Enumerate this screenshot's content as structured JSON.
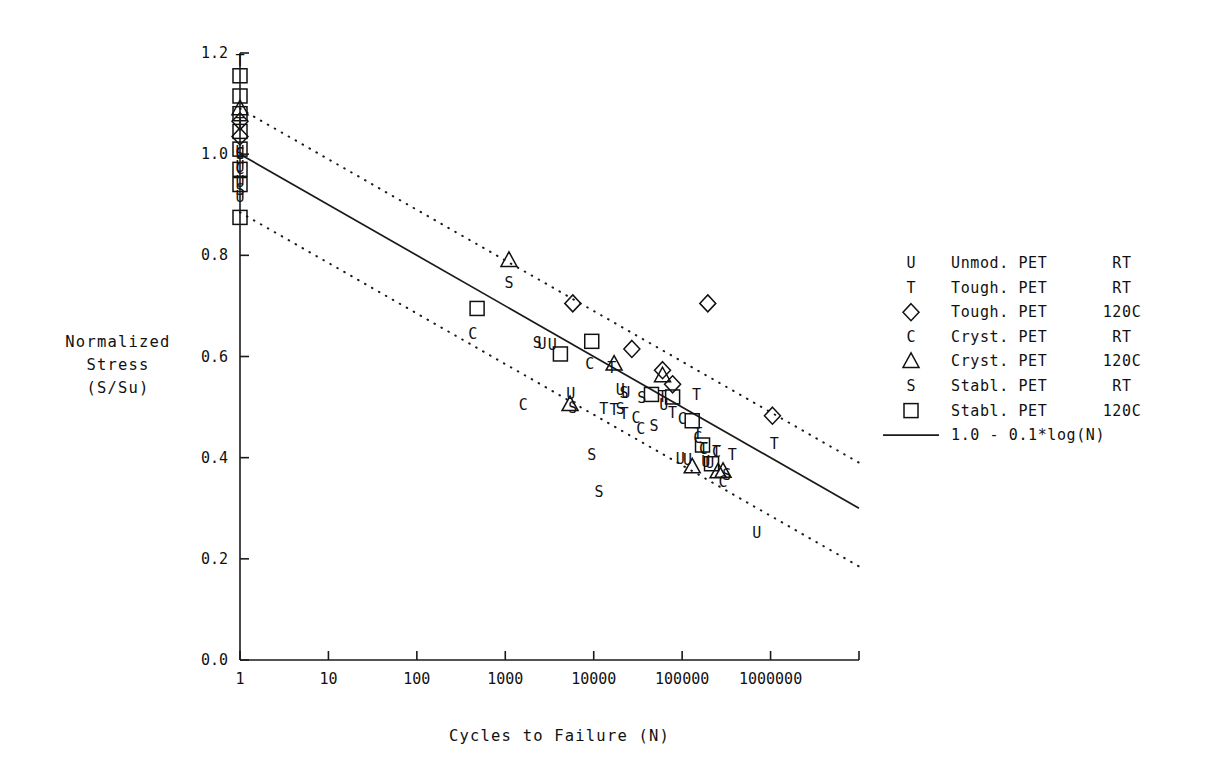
{
  "chart_data": {
    "type": "scatter",
    "title": "",
    "xlabel": "Cycles to Failure  (N)",
    "ylabel": "Normalized\nStress\n(S/Su)",
    "ylabel_lines": [
      "Normalized",
      "Stress",
      "(S/Su)"
    ],
    "xscale": "log",
    "yscale": "linear",
    "xlim": [
      1,
      10000000
    ],
    "ylim": [
      0.0,
      1.2
    ],
    "grid": false,
    "legend_position": "right",
    "xticks": [
      {
        "value": 1,
        "label": "1"
      },
      {
        "value": 10,
        "label": "10"
      },
      {
        "value": 100,
        "label": "100"
      },
      {
        "value": 1000,
        "label": "1000"
      },
      {
        "value": 10000,
        "label": "10000"
      },
      {
        "value": 100000,
        "label": "100000"
      },
      {
        "value": 1000000,
        "label": "1000000"
      },
      {
        "value": 10000000,
        "label": ""
      }
    ],
    "yticks": [
      {
        "value": 0.0,
        "label": "0.0"
      },
      {
        "value": 0.2,
        "label": "0.2"
      },
      {
        "value": 0.4,
        "label": "0.4"
      },
      {
        "value": 0.6,
        "label": "0.6"
      },
      {
        "value": 0.8,
        "label": "0.8"
      },
      {
        "value": 1.0,
        "label": "1.0"
      },
      {
        "value": 1.2,
        "label": "1.2"
      }
    ],
    "fit_line": {
      "label": "1.0 - 0.1*log(N)",
      "style": "solid",
      "intercept": 1.0,
      "slope_per_decade": -0.1,
      "x_from": 1,
      "x_to": 10000000
    },
    "bands": [
      {
        "name": "upper-bound",
        "style": "dotted",
        "offset": 0.09,
        "x_from": 1,
        "x_to": 10000000
      },
      {
        "name": "lower-bound",
        "style": "dotted",
        "offset": -0.115,
        "x_from": 1,
        "x_to": 10000000
      }
    ],
    "series": [
      {
        "name": "Unmod. PET RT",
        "key": "unmod-pet-rt",
        "marker": "U",
        "marker_type": "letter",
        "points": [
          [
            1,
            1.005
          ],
          [
            1,
            0.975
          ],
          [
            1,
            0.945
          ],
          [
            1,
            0.915
          ],
          [
            2600,
            0.625
          ],
          [
            3400,
            0.622
          ],
          [
            5500,
            0.525
          ],
          [
            20000,
            0.533
          ],
          [
            23000,
            0.527
          ],
          [
            62000,
            0.505
          ],
          [
            95000,
            0.398
          ],
          [
            115000,
            0.396
          ],
          [
            185000,
            0.392
          ],
          [
            205000,
            0.389
          ],
          [
            700000,
            0.251
          ]
        ]
      },
      {
        "name": "Tough. PET RT",
        "key": "tough-pet-rt",
        "marker": "T",
        "marker_type": "letter",
        "points": [
          [
            1,
            1.185
          ],
          [
            1,
            1.06
          ],
          [
            16000,
            0.578
          ],
          [
            13000,
            0.497
          ],
          [
            17000,
            0.494
          ],
          [
            22000,
            0.487
          ],
          [
            60000,
            0.52
          ],
          [
            78000,
            0.489
          ],
          [
            145000,
            0.524
          ],
          [
            175000,
            0.418
          ],
          [
            150000,
            0.447
          ],
          [
            245000,
            0.412
          ],
          [
            370000,
            0.405
          ],
          [
            1100000,
            0.427
          ]
        ]
      },
      {
        "name": "Tough. PET 120C",
        "key": "tough-pet-120c",
        "marker": "diamond",
        "marker_type": "symbol",
        "points": [
          [
            1,
            1.065
          ],
          [
            1,
            1.035
          ],
          [
            5800,
            0.705
          ],
          [
            27000,
            0.615
          ],
          [
            60000,
            0.573
          ],
          [
            78000,
            0.545
          ],
          [
            195000,
            0.705
          ],
          [
            1050000,
            0.483
          ]
        ]
      },
      {
        "name": "Cryst. PET RT",
        "key": "cryst-pet-rt",
        "marker": "C",
        "marker_type": "letter",
        "points": [
          [
            1,
            1.0
          ],
          [
            1,
            0.97
          ],
          [
            430,
            0.645
          ],
          [
            1600,
            0.505
          ],
          [
            9000,
            0.585
          ],
          [
            30000,
            0.478
          ],
          [
            34000,
            0.457
          ],
          [
            100000,
            0.477
          ],
          [
            150000,
            0.438
          ],
          [
            175000,
            0.418
          ],
          [
            245000,
            0.412
          ],
          [
            290000,
            0.352
          ]
        ]
      },
      {
        "name": "Cryst. PET 120C",
        "key": "cryst-pet-120c",
        "marker": "triangle",
        "marker_type": "symbol",
        "points": [
          [
            1,
            1.09
          ],
          [
            1100,
            0.79
          ],
          [
            5400,
            0.505
          ],
          [
            17000,
            0.585
          ],
          [
            60000,
            0.562
          ],
          [
            130000,
            0.382
          ],
          [
            255000,
            0.372
          ],
          [
            290000,
            0.373
          ]
        ]
      },
      {
        "name": "Stabl. PET RT",
        "key": "stabl-pet-rt",
        "marker": "S",
        "marker_type": "letter",
        "points": [
          [
            1,
            1.0
          ],
          [
            1,
            0.93
          ],
          [
            1100,
            0.745
          ],
          [
            2300,
            0.627
          ],
          [
            5800,
            0.498
          ],
          [
            9500,
            0.405
          ],
          [
            11500,
            0.332
          ],
          [
            22000,
            0.527
          ],
          [
            20000,
            0.497
          ],
          [
            35000,
            0.518
          ],
          [
            48000,
            0.463
          ],
          [
            320000,
            0.365
          ]
        ]
      },
      {
        "name": "Stabl. PET 120C",
        "key": "stabl-pet-120c",
        "marker": "square",
        "marker_type": "symbol",
        "points": [
          [
            1,
            1.155
          ],
          [
            1,
            1.115
          ],
          [
            1,
            1.08
          ],
          [
            1,
            1.045
          ],
          [
            1,
            1.01
          ],
          [
            1,
            0.97
          ],
          [
            1,
            0.94
          ],
          [
            1,
            0.875
          ],
          [
            480,
            0.695
          ],
          [
            4200,
            0.605
          ],
          [
            9500,
            0.63
          ],
          [
            45000,
            0.525
          ],
          [
            78000,
            0.52
          ],
          [
            130000,
            0.473
          ],
          [
            170000,
            0.425
          ],
          [
            215000,
            0.388
          ]
        ]
      }
    ],
    "legend_entries": [
      {
        "symbol": "U",
        "symbol_type": "letter",
        "material": "Unmod. PET",
        "temperature": "RT"
      },
      {
        "symbol": "T",
        "symbol_type": "letter",
        "material": "Tough. PET",
        "temperature": "RT"
      },
      {
        "symbol": "diamond",
        "symbol_type": "symbol",
        "material": "Tough. PET",
        "temperature": "120C"
      },
      {
        "symbol": "C",
        "symbol_type": "letter",
        "material": "Cryst. PET",
        "temperature": "RT"
      },
      {
        "symbol": "triangle",
        "symbol_type": "symbol",
        "material": "Cryst. PET",
        "temperature": "120C"
      },
      {
        "symbol": "S",
        "symbol_type": "letter",
        "material": "Stabl. PET",
        "temperature": "RT"
      },
      {
        "symbol": "square",
        "symbol_type": "symbol",
        "material": "Stabl. PET",
        "temperature": "120C"
      },
      {
        "symbol": "line",
        "symbol_type": "line",
        "material": "1.0 - 0.1*log(N)",
        "temperature": ""
      }
    ]
  },
  "colors": {
    "foreground": "#111111",
    "background": "#ffffff",
    "axis": "#1a1a1a"
  }
}
